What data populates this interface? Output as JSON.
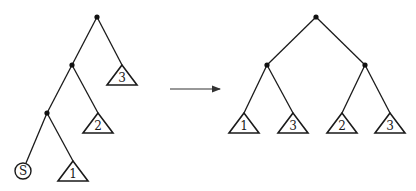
{
  "diagram": {
    "left_tree": {
      "nodes": [
        {
          "id": "L-root",
          "x": 97,
          "y": 17
        },
        {
          "id": "L-mid",
          "x": 72,
          "y": 65
        },
        {
          "id": "L-low",
          "x": 47,
          "y": 113
        }
      ],
      "edges": [
        [
          "L-root",
          "L-mid"
        ],
        [
          "L-root",
          "L-t3"
        ],
        [
          "L-mid",
          "L-low"
        ],
        [
          "L-mid",
          "L-t2"
        ],
        [
          "L-low",
          "L-s"
        ],
        [
          "L-low",
          "L-t1"
        ]
      ],
      "subtrees": [
        {
          "id": "L-t3",
          "label": "3",
          "apex_x": 122,
          "apex_y": 65,
          "base_y": 85,
          "half_width": 15
        },
        {
          "id": "L-t2",
          "label": "2",
          "apex_x": 98,
          "apex_y": 113,
          "base_y": 133,
          "half_width": 15
        },
        {
          "id": "L-t1",
          "label": "1",
          "apex_x": 73,
          "apex_y": 161,
          "base_y": 181,
          "half_width": 15
        }
      ],
      "special_leaf": {
        "id": "L-s",
        "label": "S",
        "cx": 23,
        "cy": 171,
        "r": 8
      }
    },
    "arrow": {
      "x1": 170,
      "y1": 89,
      "x2": 220,
      "y2": 89
    },
    "right_tree": {
      "nodes": [
        {
          "id": "R-root",
          "x": 316,
          "y": 17
        },
        {
          "id": "R-left",
          "x": 267,
          "y": 65
        },
        {
          "id": "R-right",
          "x": 365,
          "y": 65
        }
      ],
      "edges": [
        [
          "R-root",
          "R-left"
        ],
        [
          "R-root",
          "R-right"
        ],
        [
          "R-left",
          "R-t1"
        ],
        [
          "R-left",
          "R-t3a"
        ],
        [
          "R-right",
          "R-t2"
        ],
        [
          "R-right",
          "R-t3b"
        ]
      ],
      "subtrees": [
        {
          "id": "R-t1",
          "label": "1",
          "apex_x": 244,
          "apex_y": 113,
          "base_y": 133,
          "half_width": 15
        },
        {
          "id": "R-t3a",
          "label": "3",
          "apex_x": 293,
          "apex_y": 113,
          "base_y": 133,
          "half_width": 15
        },
        {
          "id": "R-t2",
          "label": "2",
          "apex_x": 342,
          "apex_y": 113,
          "base_y": 133,
          "half_width": 15
        },
        {
          "id": "R-t3b",
          "label": "3",
          "apex_x": 390,
          "apex_y": 113,
          "base_y": 133,
          "half_width": 15
        }
      ]
    }
  }
}
